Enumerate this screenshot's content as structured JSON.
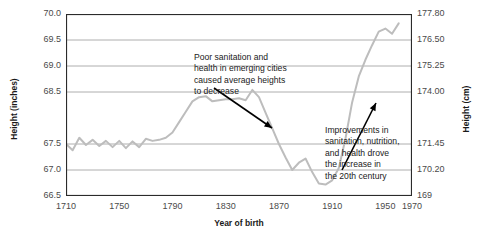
{
  "chart_data": {
    "type": "line",
    "title": "",
    "xlabel": "Year of birth",
    "ylabel": "Height (inches)",
    "ylabel_right": "Height (cm)",
    "xlim": [
      1710,
      1970
    ],
    "ylim": [
      66.5,
      70.0
    ],
    "grid": true,
    "legend": false,
    "line_color": "#bdbdbd",
    "xticks": [
      "1710",
      "1750",
      "1790",
      "1830",
      "1870",
      "1910",
      "1950",
      "1970"
    ],
    "xtick_values": [
      1710,
      1750,
      1790,
      1830,
      1870,
      1910,
      1950,
      1970
    ],
    "yticks_left": [
      "70.0",
      "69.5",
      "69.0",
      "68.5",
      "67.5",
      "67.0",
      "66.5"
    ],
    "ytick_left_values": [
      70.0,
      69.5,
      69.0,
      68.5,
      67.5,
      67.0,
      66.5
    ],
    "yticks_right": [
      "177.80",
      "176.50",
      "175.25",
      "174.00",
      "171.45",
      "170.20",
      "169"
    ],
    "ytick_right_values": [
      177.8,
      176.5,
      175.25,
      174.0,
      171.45,
      170.2,
      169.0
    ],
    "series": [
      {
        "name": "Average male height at birth year",
        "x": [
          1710,
          1715,
          1720,
          1725,
          1730,
          1735,
          1740,
          1745,
          1750,
          1755,
          1760,
          1765,
          1770,
          1775,
          1780,
          1785,
          1790,
          1795,
          1800,
          1805,
          1810,
          1815,
          1820,
          1825,
          1830,
          1835,
          1840,
          1845,
          1850,
          1855,
          1860,
          1865,
          1870,
          1875,
          1880,
          1885,
          1890,
          1895,
          1900,
          1905,
          1910,
          1915,
          1920,
          1925,
          1930,
          1935,
          1940,
          1945,
          1950,
          1955,
          1960
        ],
        "y": [
          67.5,
          67.38,
          67.62,
          67.48,
          67.58,
          67.46,
          67.56,
          67.44,
          67.56,
          67.42,
          67.55,
          67.44,
          67.6,
          67.56,
          67.58,
          67.62,
          67.72,
          67.92,
          68.12,
          68.32,
          68.4,
          68.42,
          68.32,
          68.34,
          68.36,
          68.36,
          68.38,
          68.34,
          68.54,
          68.4,
          68.1,
          67.8,
          67.5,
          67.24,
          67.0,
          67.14,
          67.22,
          66.96,
          66.74,
          66.72,
          66.8,
          67.04,
          67.6,
          68.3,
          68.8,
          69.12,
          69.4,
          69.66,
          69.72,
          69.62,
          69.82
        ]
      }
    ],
    "annotations": [
      {
        "id": "annot-1",
        "lines": [
          "Poor sanitation and",
          "health in emerging cities",
          "caused average heights",
          "to decrease"
        ],
        "arrow_from": [
          214,
          88
        ],
        "arrow_to": [
          272,
          128
        ]
      },
      {
        "id": "annot-2",
        "lines": [
          "Improvements in",
          "sanitation, nutrition,",
          "and health drove",
          "the increase in",
          "the 20th century"
        ],
        "arrow_from": [
          342,
          170
        ],
        "arrow_to": [
          376,
          103
        ]
      }
    ]
  }
}
